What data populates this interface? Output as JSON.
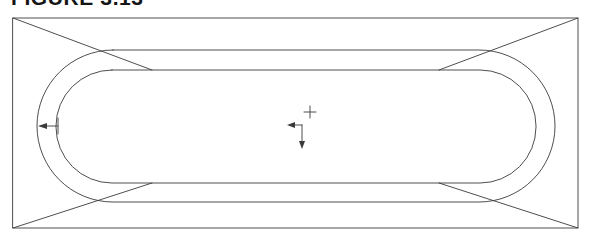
{
  "figure": {
    "caption": "FIGURE 3.13"
  },
  "canvas": {
    "width": 593,
    "height": 244,
    "background": "#ffffff",
    "line_color": "#3a3a3a",
    "line_width": 0.9
  },
  "drawing": {
    "outer_rectangle": {
      "name": "tub-rim-outline",
      "x": 13,
      "y": 18,
      "width": 565,
      "height": 210
    },
    "corner_diagonals": {
      "name": "corner-miter-lines",
      "lines": [
        {
          "x1": 13,
          "y1": 18,
          "x2": 152,
          "y2": 70
        },
        {
          "x1": 578,
          "y1": 18,
          "x2": 439,
          "y2": 70
        },
        {
          "x1": 13,
          "y1": 228,
          "x2": 152,
          "y2": 183
        },
        {
          "x1": 578,
          "y1": 228,
          "x2": 439,
          "y2": 183
        }
      ]
    },
    "outer_stadium": {
      "name": "tub-outer-wall",
      "x": 37,
      "y": 50,
      "width": 518,
      "height": 152,
      "radius": 76
    },
    "inner_stadium": {
      "name": "tub-inner-basin",
      "x": 56,
      "y": 70,
      "width": 480,
      "height": 113,
      "radius": 56
    },
    "wall_thickness_dimension": {
      "name": "wall-thickness-arrow",
      "arrow_tip_x": 41,
      "arrow_tail_x": 58,
      "y": 126,
      "tick_top_y": 118,
      "tick_bottom_y": 134
    },
    "drain_crosshair": {
      "name": "drain-center-crosshair",
      "cx": 310,
      "cy": 112,
      "arm": 6
    },
    "axis_leader": {
      "name": "origin-axis-leader",
      "corner_x": 302,
      "corner_y": 125,
      "left_tip_x": 288,
      "down_tip_y": 148
    }
  }
}
